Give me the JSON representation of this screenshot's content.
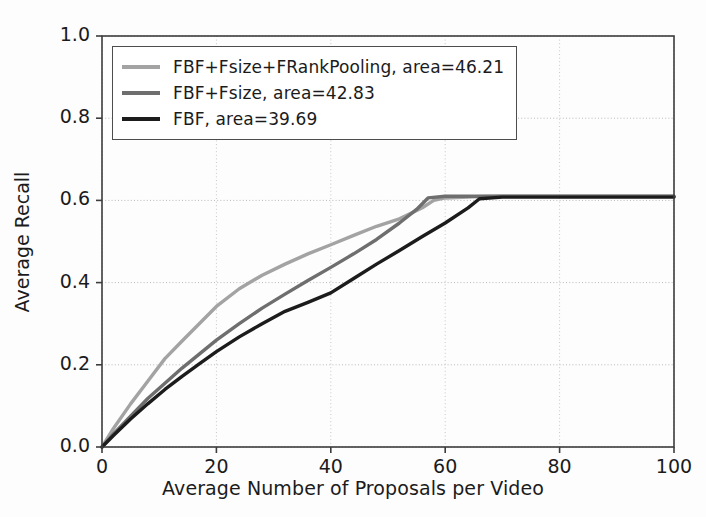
{
  "chart_data": {
    "type": "line",
    "title": "",
    "xlabel": "Average Number of Proposals per Video",
    "ylabel": "Average Recall",
    "xlim": [
      0,
      100
    ],
    "ylim": [
      0.0,
      1.0
    ],
    "xticks": [
      "0",
      "20",
      "40",
      "60",
      "80",
      "100"
    ],
    "xtick_values": [
      0,
      20,
      40,
      60,
      80,
      100
    ],
    "yticks": [
      "0.0",
      "0.2",
      "0.4",
      "0.6",
      "0.8",
      "1.0"
    ],
    "ytick_values": [
      0.0,
      0.2,
      0.4,
      0.6,
      0.8,
      1.0
    ],
    "grid": true,
    "legend_position": "upper left",
    "series": [
      {
        "name": "FBF+Fsize+FRankPooling",
        "area": 46.21,
        "legend_label": "FBF+Fsize+FRankPooling,  area=46.21",
        "color": "#a3a3a3",
        "x": [
          0,
          2,
          5,
          8,
          11,
          14,
          17,
          20,
          24,
          28,
          32,
          36,
          40,
          44,
          48,
          52,
          56,
          58,
          60,
          65,
          70,
          80,
          90,
          100
        ],
        "y": [
          0.0,
          0.045,
          0.105,
          0.16,
          0.215,
          0.258,
          0.3,
          0.342,
          0.385,
          0.418,
          0.445,
          0.47,
          0.492,
          0.515,
          0.537,
          0.555,
          0.582,
          0.6,
          0.606,
          0.609,
          0.61,
          0.61,
          0.61,
          0.61
        ]
      },
      {
        "name": "FBF+Fsize",
        "area": 42.83,
        "legend_label": "FBF+Fsize,  area=42.83",
        "color": "#6e6e6e",
        "x": [
          0,
          2,
          5,
          8,
          11,
          14,
          17,
          20,
          24,
          28,
          32,
          36,
          40,
          44,
          48,
          52,
          55,
          57,
          60,
          65,
          70,
          80,
          90,
          100
        ],
        "y": [
          0.0,
          0.032,
          0.075,
          0.118,
          0.155,
          0.192,
          0.226,
          0.26,
          0.3,
          0.338,
          0.372,
          0.405,
          0.437,
          0.47,
          0.505,
          0.545,
          0.578,
          0.606,
          0.61,
          0.61,
          0.61,
          0.61,
          0.61,
          0.61
        ]
      },
      {
        "name": "FBF",
        "area": 39.69,
        "legend_label": "FBF,  area=39.69",
        "color": "#1c1c1c",
        "x": [
          0,
          2,
          5,
          8,
          11,
          14,
          17,
          20,
          24,
          28,
          32,
          36,
          40,
          44,
          48,
          52,
          56,
          60,
          64,
          66,
          70,
          80,
          90,
          100
        ],
        "y": [
          0.0,
          0.028,
          0.068,
          0.105,
          0.14,
          0.172,
          0.202,
          0.232,
          0.268,
          0.3,
          0.33,
          0.352,
          0.375,
          0.41,
          0.445,
          0.478,
          0.512,
          0.545,
          0.582,
          0.604,
          0.608,
          0.608,
          0.608,
          0.608
        ]
      }
    ]
  },
  "plot_geometry": {
    "left": 102,
    "top": 36,
    "right": 674,
    "bottom": 447
  }
}
